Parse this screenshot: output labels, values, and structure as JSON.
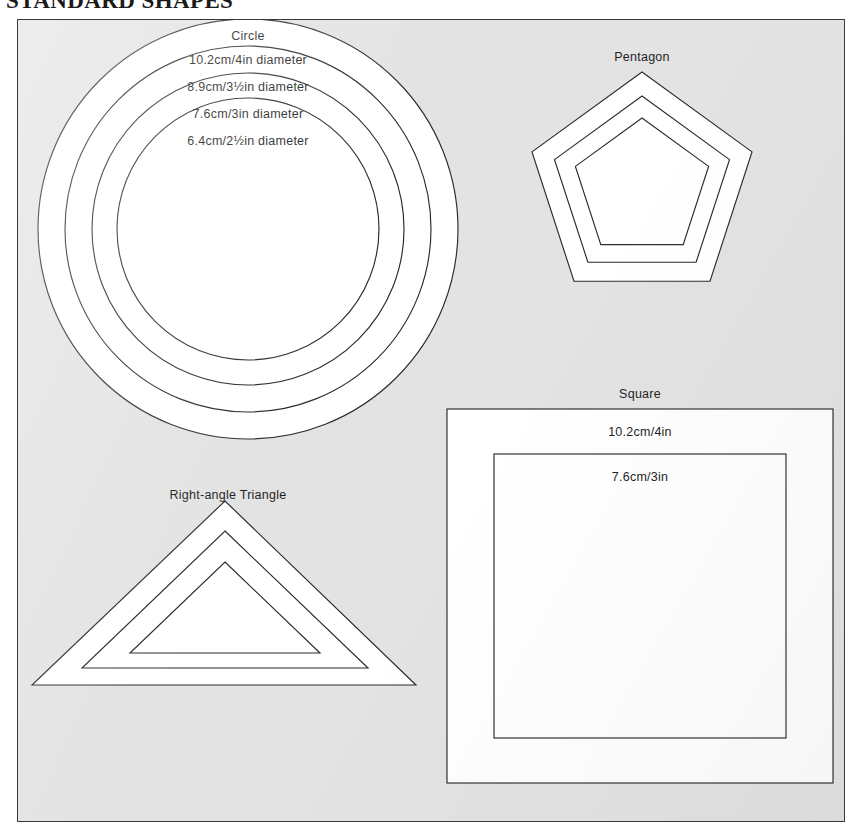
{
  "page": {
    "title": "STANDARD SHAPES"
  },
  "plate": {
    "background_color": "#e3e3e3",
    "border_color": "#3a3a3a",
    "shape_fill_color": "#ffffff",
    "shape_stroke_color": "#2b2b2b"
  },
  "shapes": [
    {
      "id": "circle",
      "name": "Circle",
      "label": "Circle",
      "ring_count": 4,
      "sizes": [
        "10.2cm/4in diameter",
        "8.9cm/3½in diameter",
        "7.6cm/3in diameter",
        "6.4cm/2½in diameter"
      ]
    },
    {
      "id": "pentagon",
      "name": "Pentagon",
      "label": "Pentagon",
      "ring_count": 3,
      "sizes": []
    },
    {
      "id": "triangle",
      "name": "Right-angle Triangle",
      "label": "Right-angle Triangle",
      "ring_count": 3,
      "sizes": []
    },
    {
      "id": "square",
      "name": "Square",
      "label": "Square",
      "ring_count": 2,
      "sizes": [
        "10.2cm/4in",
        "7.6cm/3in"
      ]
    }
  ]
}
